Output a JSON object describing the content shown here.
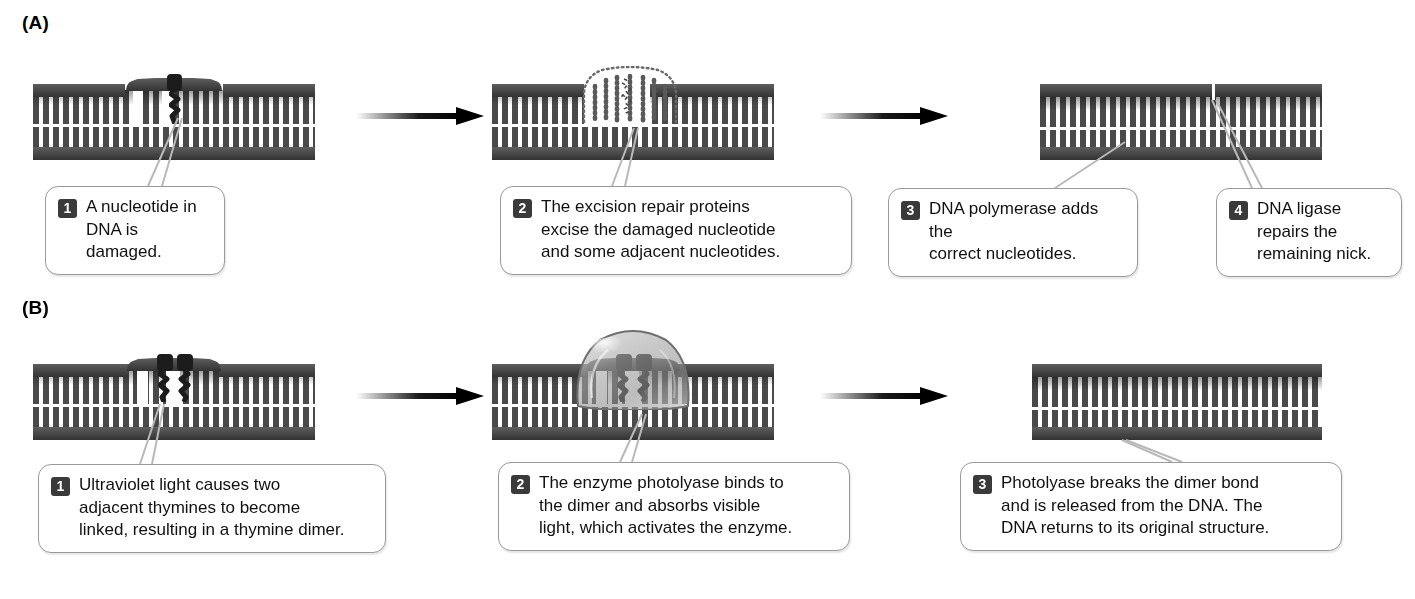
{
  "figure": {
    "panels": [
      {
        "id": "A",
        "label": "(A)",
        "process": "nucleotide excision repair",
        "steps": [
          {
            "number": "1",
            "text": "A nucleotide in\nDNA is damaged.",
            "stage": "damaged-nucleotide"
          },
          {
            "number": "2",
            "text": "The excision repair proteins\nexcise the damaged nucleotide\nand some adjacent nucleotides.",
            "stage": "excision"
          },
          {
            "number": "3",
            "text": "DNA polymerase adds the\ncorrect nucleotides.",
            "stage": "polymerase-fill"
          },
          {
            "number": "4",
            "text": "DNA ligase\nrepairs the\nremaining nick.",
            "stage": "ligase-seal"
          }
        ]
      },
      {
        "id": "B",
        "label": "(B)",
        "process": "photoreactivation repair",
        "steps": [
          {
            "number": "1",
            "text": "Ultraviolet light causes two\nadjacent thymines to become\nlinked, resulting in a thymine dimer.",
            "stage": "thymine-dimer"
          },
          {
            "number": "2",
            "text": "The enzyme photolyase binds to\nthe dimer and absorbs visible\nlight, which activates the enzyme.",
            "stage": "photolyase-bound"
          },
          {
            "number": "3",
            "text": "Photolyase breaks the dimer bond\nand is released from the DNA. The\nDNA returns to its original structure.",
            "stage": "repaired-dna"
          }
        ]
      }
    ],
    "icons": {
      "arrow": "right-arrow-icon",
      "dna": "dna-double-helix-icon",
      "lesion": "damaged-nucleotide-icon",
      "dimer": "thymine-dimer-icon",
      "enzyme": "photolyase-enzyme-icon",
      "excised": "excised-fragment-outline-icon",
      "nick": "dna-nick-icon"
    },
    "colors": {
      "background": "#ffffff",
      "dna_backbone": "#4a4a4a",
      "dna_backbone_dark": "#333333",
      "rung": "#4a4a4a",
      "gap": "#ffffff",
      "lesion": "#1c1c1c",
      "badge_bg": "#3a3a3a",
      "badge_text": "#ffffff",
      "callout_border": "#9a9a9a",
      "callout_bg": "#ffffff",
      "text": "#111111",
      "arrow": "#000000",
      "enzyme_fill": "#9a9a9a",
      "leader_line": "#b8b8b8"
    }
  }
}
